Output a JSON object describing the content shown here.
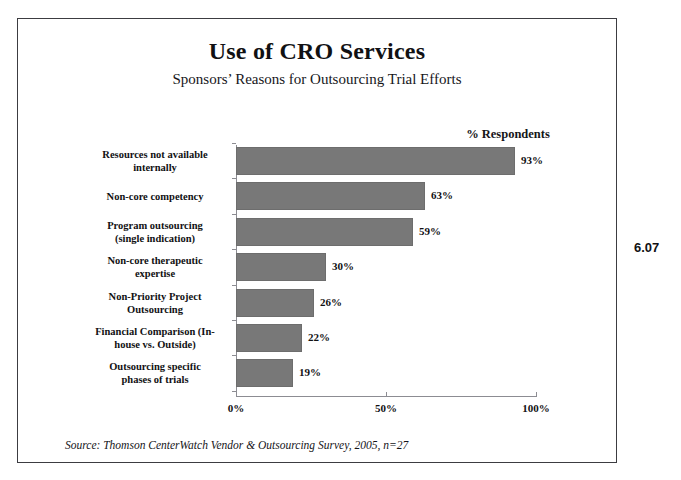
{
  "figure": {
    "number": "6.07"
  },
  "source_note": "Source: Thomson CenterWatch Vendor & Outsourcing Survey, 2005, n=27",
  "chart_data": {
    "type": "bar",
    "orientation": "horizontal",
    "title": "Use of CRO Services",
    "subtitle": "Sponsors’ Reasons for Outsourcing Trial Efforts",
    "value_axis_label": "% Respondents",
    "xlabel": "",
    "ylabel": "",
    "xlim": [
      0,
      100
    ],
    "grid": false,
    "legend": "none",
    "bar_color": "#787878",
    "categories": [
      "Resources not available internally",
      "Non-core competency",
      "Program outsourcing (single indication)",
      "Non-core therapeutic expertise",
      "Non-Priority Project Outsourcing",
      "Financial Comparison (In-house vs. Outside)",
      "Outsourcing specific phases of trials"
    ],
    "category_lines": [
      [
        "Resources not available",
        "internally"
      ],
      [
        "Non-core competency"
      ],
      [
        "Program outsourcing",
        "(single indication)"
      ],
      [
        "Non-core therapeutic",
        "expertise"
      ],
      [
        "Non-Priority Project",
        "Outsourcing"
      ],
      [
        "Financial Comparison (In-",
        "house vs. Outside)"
      ],
      [
        "Outsourcing specific",
        "phases of trials"
      ]
    ],
    "values": [
      93,
      63,
      59,
      30,
      26,
      22,
      19
    ],
    "value_labels": [
      "93%",
      "63%",
      "59%",
      "30%",
      "26%",
      "22%",
      "19%"
    ],
    "xticks": [
      0,
      50,
      100
    ],
    "xtick_labels": [
      "0%",
      "50%",
      "100%"
    ]
  }
}
